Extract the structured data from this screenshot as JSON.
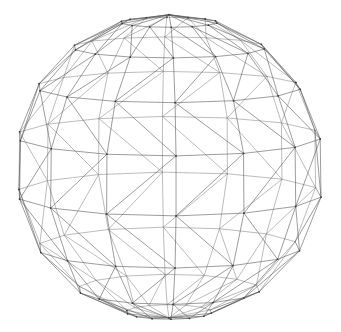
{
  "figure": {
    "background_color": "#ffffff",
    "line_color": "#5a5a5a",
    "back_line_color": "#8e8e8e",
    "vertex_color": "#3c3c3c",
    "line_width": 0.6,
    "canvas": {
      "width": 341,
      "height": 332
    }
  },
  "geometry": {
    "type": "uv-sphere-triangulated",
    "description": "Wireframe globe drawn as triangulated latitude-longitude mesh with flat polygonal caps at both poles, viewed in slight perspective and tilted so the equator bows downward across the middle.",
    "center": {
      "x": 169,
      "y": 167
    },
    "radius_x": 156,
    "radius_y": 153,
    "segments_longitude": 14,
    "bands_latitude": 8,
    "tilt_degrees": 8,
    "perspective": 0.28,
    "latitude_rows": [
      {
        "name": "north-cap",
        "polar_angle_deg": 18,
        "vertex_count": 14
      },
      {
        "name": "north-ring-1",
        "polar_angle_deg": 38,
        "vertex_count": 14
      },
      {
        "name": "north-ring-2",
        "polar_angle_deg": 58,
        "vertex_count": 14
      },
      {
        "name": "equator",
        "polar_angle_deg": 78,
        "vertex_count": 14
      },
      {
        "name": "equator-lower",
        "polar_angle_deg": 100,
        "vertex_count": 14
      },
      {
        "name": "south-ring-2",
        "polar_angle_deg": 122,
        "vertex_count": 14
      },
      {
        "name": "south-ring-1",
        "polar_angle_deg": 144,
        "vertex_count": 14
      },
      {
        "name": "south-cap",
        "polar_angle_deg": 164,
        "vertex_count": 14
      }
    ],
    "edge_sets": [
      {
        "name": "latitude-lines",
        "visible": true
      },
      {
        "name": "longitude-lines",
        "visible": true
      },
      {
        "name": "diagonal-bracing",
        "visible": true
      }
    ],
    "bounds_observed": {
      "left_x": 13,
      "right_x": 325,
      "top_y": 15,
      "bottom_y": 320
    }
  }
}
